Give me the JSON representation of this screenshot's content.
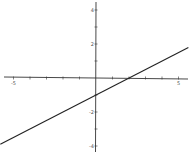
{
  "chart_data": {
    "type": "line",
    "title": "",
    "xlabel": "",
    "ylabel": "",
    "xlim": [
      -5.8,
      5.7
    ],
    "ylim": [
      -4.3,
      4.4
    ],
    "grid": false,
    "x_ticks": [
      -5,
      -4,
      -3,
      -2,
      -1,
      0,
      1,
      2,
      3,
      4,
      5
    ],
    "y_ticks": [
      -4,
      -3,
      -2,
      -1,
      1,
      2,
      3,
      4
    ],
    "x_tick_labels": [
      {
        "value": -5,
        "label": "-5"
      },
      {
        "value": 5,
        "label": "5"
      }
    ],
    "y_tick_labels": [
      {
        "value": 4,
        "label": "4"
      },
      {
        "value": 2,
        "label": "2"
      },
      {
        "value": -2,
        "label": "-2"
      },
      {
        "value": -4,
        "label": "-4"
      }
    ],
    "series": [
      {
        "name": "y = 0.5x - 1",
        "slope": 0.5,
        "intercept": -1,
        "x": [
          -5.8,
          5.6
        ],
        "y": [
          -3.9,
          1.8
        ],
        "color": "#222222"
      }
    ]
  },
  "colors": {
    "axis": "#333333",
    "line": "#222222",
    "label": "#555555"
  }
}
